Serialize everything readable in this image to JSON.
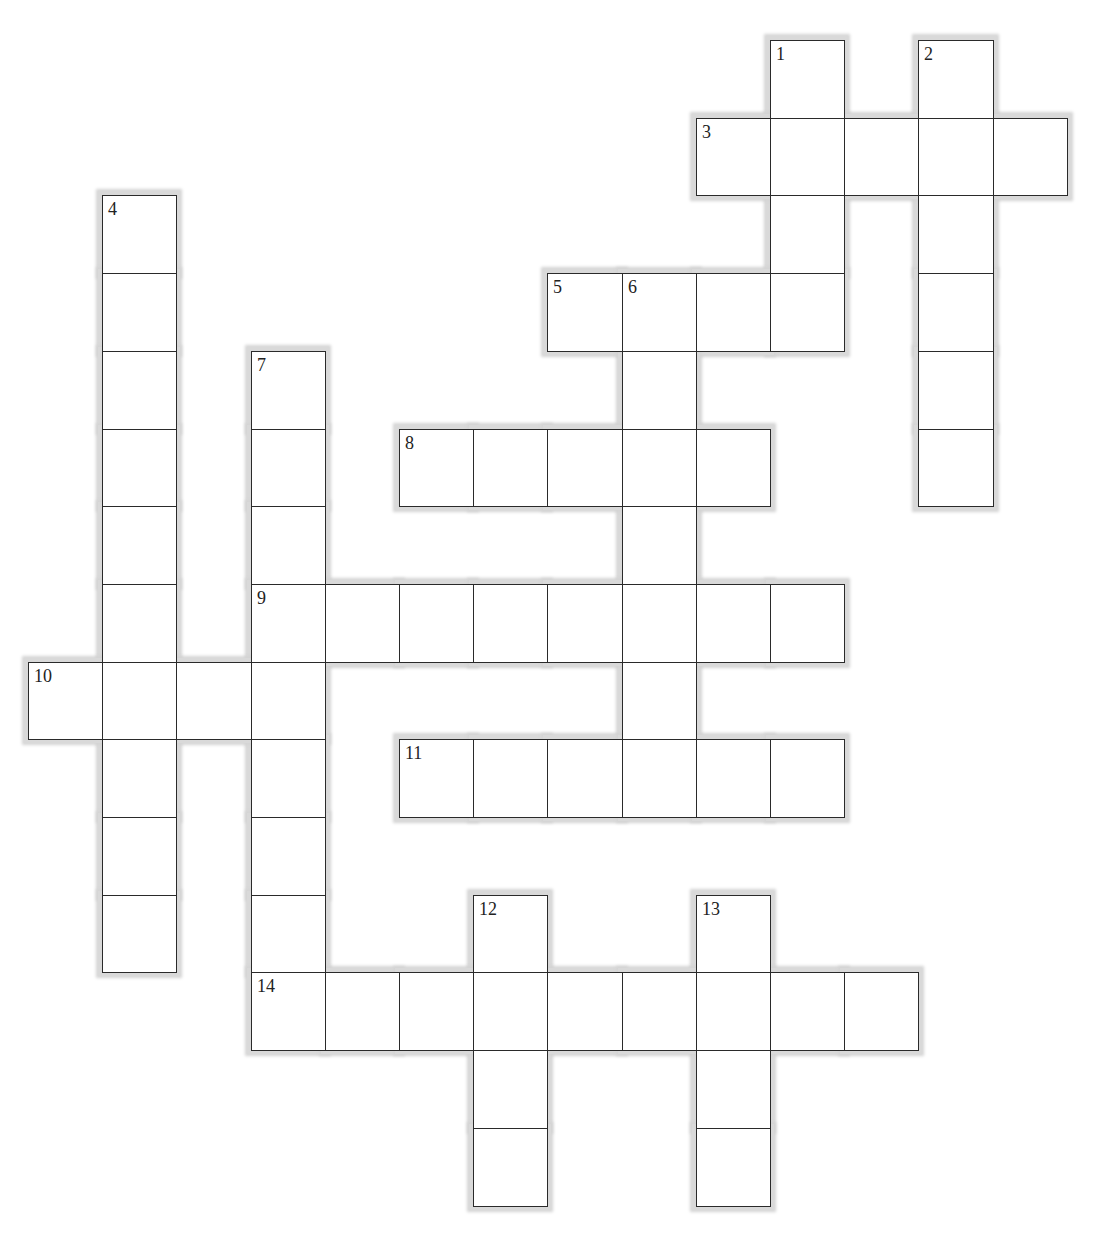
{
  "puzzle": {
    "type": "crossword",
    "grid": {
      "origin_x": 28,
      "origin_y": 40,
      "cell_w": 74.2,
      "cell_h": 77.7,
      "columns": 15,
      "rows": 15
    },
    "colors": {
      "border": "#2a2a2a",
      "halo": "#d9d9d9",
      "cell": "#ffffff",
      "number": "#222222"
    },
    "words": [
      {
        "number": 1,
        "direction": "down",
        "col": 10,
        "row": 0,
        "length": 4
      },
      {
        "number": 2,
        "direction": "down",
        "col": 12,
        "row": 0,
        "length": 6
      },
      {
        "number": 3,
        "direction": "across",
        "col": 9,
        "row": 1,
        "length": 5
      },
      {
        "number": 4,
        "direction": "down",
        "col": 1,
        "row": 2,
        "length": 10
      },
      {
        "number": 5,
        "direction": "across",
        "col": 7,
        "row": 3,
        "length": 4
      },
      {
        "number": 6,
        "direction": "down",
        "col": 8,
        "row": 3,
        "length": 6
      },
      {
        "number": 7,
        "direction": "down",
        "col": 3,
        "row": 4,
        "length": 9
      },
      {
        "number": 8,
        "direction": "across",
        "col": 5,
        "row": 5,
        "length": 5
      },
      {
        "number": 9,
        "direction": "across",
        "col": 3,
        "row": 7,
        "length": 8
      },
      {
        "number": 10,
        "direction": "across",
        "col": 0,
        "row": 8,
        "length": 4
      },
      {
        "number": 11,
        "direction": "across",
        "col": 5,
        "row": 9,
        "length": 6
      },
      {
        "number": 12,
        "direction": "down",
        "col": 6,
        "row": 11,
        "length": 4
      },
      {
        "number": 13,
        "direction": "down",
        "col": 9,
        "row": 11,
        "length": 4
      },
      {
        "number": 14,
        "direction": "across",
        "col": 3,
        "row": 12,
        "length": 9
      }
    ]
  }
}
